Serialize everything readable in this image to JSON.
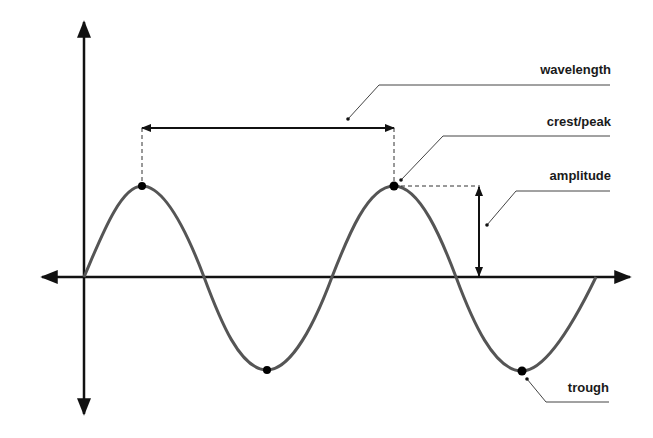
{
  "diagram": {
    "title": "",
    "type": "wave-anatomy",
    "labels": {
      "wavelength": "wavelength",
      "crest": "crest/peak",
      "amplitude": "amplitude",
      "trough": "trough"
    },
    "colors": {
      "wave": "#555555",
      "axes": "#111111",
      "points": "#000000",
      "text": "#1a1a1a",
      "leader": "#444444"
    },
    "points": {
      "origin": [
        84,
        277
      ],
      "peaks": [
        [
          142,
          186
        ],
        [
          394,
          186
        ]
      ],
      "troughs": [
        [
          267,
          370
        ],
        [
          522,
          371
        ]
      ]
    }
  }
}
